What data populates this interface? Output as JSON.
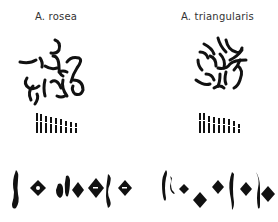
{
  "figure": {
    "species": [
      {
        "name": "A. rosea",
        "metaphase_spread": "scattered-chromosomes",
        "karyotype_pairs": 9,
        "meiotic_figures": 8
      },
      {
        "name": "A. triangularis",
        "metaphase_spread": "scattered-chromosomes",
        "karyotype_pairs": 9,
        "meiotic_figures": 8
      }
    ],
    "colors": {
      "ink": "#111111",
      "background": "#ffffff",
      "label": "#333333"
    }
  }
}
